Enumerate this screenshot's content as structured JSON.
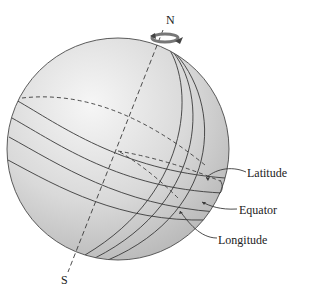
{
  "figure": {
    "labels": {
      "north": "N",
      "south": "S",
      "latitude": "Latitude",
      "equator": "Equator",
      "longitude": "Longitude"
    },
    "icons": {
      "rotation_arrow": "curved-rotation-arrow-icon"
    },
    "colors": {
      "globe_fill_light": "#f4f4f4",
      "globe_fill_dark": "#b9b9b9",
      "line": "#3a3a3a",
      "text": "#222222"
    }
  }
}
